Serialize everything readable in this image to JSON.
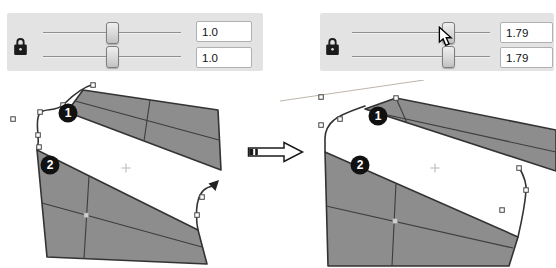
{
  "panels": {
    "before": {
      "locked": true,
      "lock_icon": "lock-icon",
      "sliders": [
        {
          "name": "scale-x",
          "value": "1.0",
          "position_pct": 50
        },
        {
          "name": "scale-y",
          "value": "1.0",
          "position_pct": 50
        }
      ]
    },
    "after": {
      "locked": true,
      "lock_icon": "lock-icon",
      "sliders": [
        {
          "name": "scale-x",
          "value": "1.79",
          "position_pct": 71
        },
        {
          "name": "scale-y",
          "value": "1.79",
          "position_pct": 71
        }
      ],
      "cursor": "pointer-on-first-slider-handle"
    }
  },
  "figures": {
    "before": {
      "markers": [
        {
          "label": "1"
        },
        {
          "label": "2"
        }
      ]
    },
    "after": {
      "markers": [
        {
          "label": "1"
        },
        {
          "label": "2"
        }
      ]
    }
  },
  "transition": {
    "icon": "result-arrow",
    "meaning": "before-to-after"
  },
  "colors": {
    "panel_bg": "#e3e3e3",
    "mesh_fill": "#8d8d8d",
    "mesh_stroke": "#333333",
    "marker_bg": "#111111",
    "guide_line": "#bdb5a9",
    "value_box_border": "#b0b0b0"
  }
}
